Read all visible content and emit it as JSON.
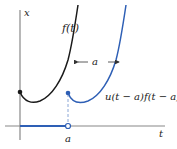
{
  "diagram": {
    "axes": {
      "vertical_label": "x",
      "horizontal_label": "t",
      "tick_label": "a"
    },
    "curves": {
      "original": {
        "label": "f(t)",
        "color": "#1a1a1a"
      },
      "shifted": {
        "label": "u(t − a)f(t − a)",
        "color": "#2e5fb5"
      }
    },
    "shift_annotation": "a",
    "colors": {
      "axis": "#888888",
      "step_line": "#2e5fb5",
      "dashed": "#8aa6d6"
    }
  }
}
